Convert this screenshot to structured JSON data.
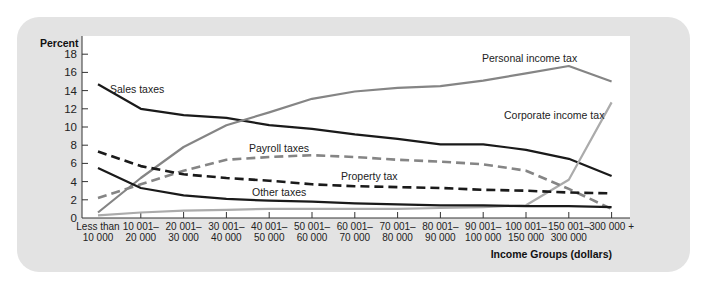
{
  "chart_data": {
    "type": "line",
    "title": "",
    "xlabel": "Income Groups (dollars)",
    "ylabel": "Percent",
    "ylim": [
      0,
      18
    ],
    "yticks": [
      0,
      2,
      4,
      6,
      8,
      10,
      12,
      14,
      16,
      18
    ],
    "grid": false,
    "legend_position": "inline labels",
    "categories": [
      [
        "Less than",
        "10 000"
      ],
      [
        "10 001–",
        "20 000"
      ],
      [
        "20 001–",
        "30 000"
      ],
      [
        "30 001–",
        "40 000"
      ],
      [
        "40 001–",
        "50 000"
      ],
      [
        "50 001–",
        "60 000"
      ],
      [
        "60 001–",
        "70 000"
      ],
      [
        "70 001–",
        "80 000"
      ],
      [
        "80 001–",
        "90 000"
      ],
      [
        "90 001–",
        "100 000"
      ],
      [
        "100 001–",
        "150 000"
      ],
      [
        "150 001–",
        "300 000"
      ],
      [
        "300 000 +",
        ""
      ]
    ],
    "series": [
      {
        "name": "Sales taxes",
        "color": "#1a1a1a",
        "dash": false,
        "label_pos": [
          110,
          93
        ],
        "values": [
          14.7,
          12.0,
          11.3,
          11.0,
          10.2,
          9.8,
          9.2,
          8.7,
          8.1,
          8.1,
          7.5,
          6.5,
          4.6
        ]
      },
      {
        "name": "Personal income tax",
        "color": "#858585",
        "dash": false,
        "label_pos": [
          482,
          62
        ],
        "values": [
          0.6,
          4.4,
          7.8,
          10.2,
          11.6,
          13.1,
          13.9,
          14.3,
          14.5,
          15.1,
          15.9,
          16.7,
          15.0
        ]
      },
      {
        "name": "Corporate income tax",
        "color": "#ababab",
        "dash": false,
        "label_pos": [
          504,
          119
        ],
        "values": [
          0.3,
          0.6,
          0.8,
          0.9,
          1.0,
          1.0,
          1.0,
          1.0,
          1.1,
          1.2,
          1.4,
          4.2,
          12.7
        ]
      },
      {
        "name": "Payroll taxes",
        "color": "#858585",
        "dash": true,
        "label_pos": [
          249,
          152
        ],
        "values": [
          2.2,
          3.7,
          5.2,
          6.4,
          6.7,
          6.9,
          6.7,
          6.4,
          6.2,
          5.9,
          5.2,
          3.2,
          1.0
        ]
      },
      {
        "name": "Property tax",
        "color": "#1a1a1a",
        "dash": true,
        "label_pos": [
          341,
          180
        ],
        "values": [
          7.3,
          5.7,
          4.8,
          4.4,
          4.1,
          3.7,
          3.5,
          3.4,
          3.3,
          3.1,
          3.0,
          2.8,
          2.7
        ]
      },
      {
        "name": "Other taxes",
        "color": "#1a1a1a",
        "dash": false,
        "label_pos": [
          252,
          196
        ],
        "values": [
          5.5,
          3.3,
          2.5,
          2.1,
          1.9,
          1.8,
          1.6,
          1.5,
          1.4,
          1.4,
          1.3,
          1.3,
          1.2
        ]
      }
    ]
  },
  "colors": {
    "panel": "#e3e3e3",
    "plot_bg": "#ffffff"
  }
}
